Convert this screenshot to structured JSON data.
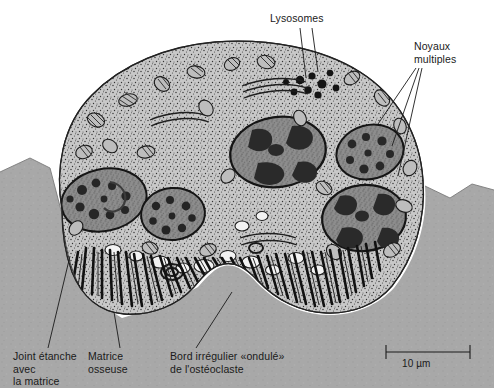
{
  "figure": {
    "background_color": "#ffffff",
    "ink_color": "#1a1a1a",
    "bone_matrix_color": "#a8a8a8",
    "cytoplasm_color": "#b5b5b5",
    "nucleus_color": "#6e6e6e",
    "chromatin_color": "#2c2c2c"
  },
  "labels": {
    "lysosomes": "Lysosomes",
    "noyaux": "Noyaux\nmultiples",
    "joint": "Joint étanche\navec\nla matrice",
    "matrice": "Matrice\nosseuse",
    "bord": "Bord irrégulier «ondulé»\nde l'ostéoclaste"
  },
  "scalebar": {
    "value": "10 µm",
    "length_px": 84
  },
  "structures": [
    {
      "name": "osteoclast-cell-body",
      "type": "cell"
    },
    {
      "name": "ruffled-border",
      "type": "membrane"
    },
    {
      "name": "sealing-zone",
      "type": "membrane"
    },
    {
      "name": "bone-matrix",
      "type": "tissue"
    },
    {
      "name": "nucleus-1",
      "type": "nucleus"
    },
    {
      "name": "nucleus-2",
      "type": "nucleus"
    },
    {
      "name": "nucleus-3",
      "type": "nucleus"
    },
    {
      "name": "nucleus-4",
      "type": "nucleus"
    },
    {
      "name": "nucleus-5",
      "type": "nucleus"
    },
    {
      "name": "lysosome-cluster",
      "type": "organelle"
    },
    {
      "name": "mitochondria",
      "type": "organelle"
    },
    {
      "name": "vacuoles",
      "type": "organelle"
    }
  ]
}
